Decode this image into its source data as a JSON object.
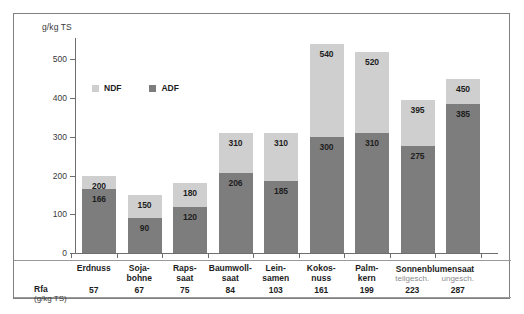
{
  "chart_data": {
    "type": "bar",
    "title": "",
    "subtitle": "",
    "xlabel": "",
    "ylabel": "g/kg TS",
    "ylim": [
      0,
      560
    ],
    "yticks": [
      0,
      100,
      200,
      300,
      400,
      500
    ],
    "grid": false,
    "stacked": true,
    "legend_position": "upper-left-inside",
    "categories": [
      "Erdnuss",
      "Soja-bohne",
      "Raps-saat",
      "Baumwoll-saat",
      "Lein-samen",
      "Kokos-nuss",
      "Palm-kern",
      "Sonnenblumensaat teilgesch.",
      "Sonnenblumensaat ungesch."
    ],
    "series": [
      {
        "name": "NDF",
        "color": "#cfcfcf",
        "values": [
          200,
          150,
          180,
          310,
          310,
          540,
          520,
          395,
          450
        ]
      },
      {
        "name": "ADF",
        "color": "#7d7d7d",
        "values": [
          166,
          90,
          120,
          206,
          185,
          300,
          310,
          275,
          385
        ]
      }
    ],
    "row_rfa": {
      "label": "Rfa",
      "unit": "(g/kg TS)",
      "values": [
        57,
        67,
        75,
        84,
        103,
        161,
        199,
        223,
        287
      ]
    }
  },
  "axis": {
    "y_title": "g/kg TS",
    "ticks": [
      {
        "label": "500",
        "value": 500
      },
      {
        "label": "400",
        "value": 400
      },
      {
        "label": "300",
        "value": 300
      },
      {
        "label": "200",
        "value": 200
      },
      {
        "label": "100",
        "value": 100
      },
      {
        "label": "0",
        "value": 0
      }
    ]
  },
  "legend": {
    "items": [
      {
        "label": "NDF",
        "color": "#cfcfcf"
      },
      {
        "label": "ADF",
        "color": "#7d7d7d"
      }
    ]
  },
  "bars": [
    {
      "cat_line1": "Erdnuss",
      "cat_line2": "",
      "sub": "",
      "ndf": "200",
      "adf": "166",
      "rfa": "57"
    },
    {
      "cat_line1": "Soja-",
      "cat_line2": "bohne",
      "sub": "",
      "ndf": "150",
      "adf": "90",
      "rfa": "67"
    },
    {
      "cat_line1": "Raps-",
      "cat_line2": "saat",
      "sub": "",
      "ndf": "180",
      "adf": "120",
      "rfa": "75"
    },
    {
      "cat_line1": "Baumwoll-",
      "cat_line2": "saat",
      "sub": "",
      "ndf": "310",
      "adf": "206",
      "rfa": "84"
    },
    {
      "cat_line1": "Lein-",
      "cat_line2": "samen",
      "sub": "",
      "ndf": "310",
      "adf": "185",
      "rfa": "103"
    },
    {
      "cat_line1": "Kokos-",
      "cat_line2": "nuss",
      "sub": "",
      "ndf": "540",
      "adf": "300",
      "rfa": "161"
    },
    {
      "cat_line1": "Palm-",
      "cat_line2": "kern",
      "sub": "",
      "ndf": "520",
      "adf": "310",
      "rfa": "199"
    },
    {
      "cat_line1": "",
      "cat_line2": "",
      "sub": "teilgesch.",
      "ndf": "395",
      "adf": "275",
      "rfa": "223"
    },
    {
      "cat_line1": "",
      "cat_line2": "",
      "sub": "ungesch.",
      "ndf": "450",
      "adf": "385",
      "rfa": "287"
    }
  ],
  "group_label": {
    "text": "Sonnenblumensaat"
  },
  "rfa": {
    "label": "Rfa",
    "unit": "(g/kg TS)"
  },
  "colors": {
    "ndf": "#cfcfcf",
    "adf": "#7d7d7d",
    "frame": "#808080",
    "text": "#1d1d1d"
  }
}
